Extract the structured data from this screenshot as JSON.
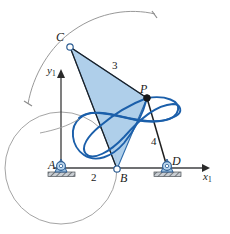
{
  "figure": {
    "background_color": "#ffffff",
    "width": 230,
    "height": 234
  },
  "colors": {
    "coupler_fill": "#a8cbe8",
    "coupler_stroke": "#1f5fa8",
    "coupler_curve": "#1b5faa",
    "link_line": "#262626",
    "ground_line": "#6f7072",
    "crank_circle": "#9a9a9a",
    "arc_path": "#8c8c8c",
    "pivot_body": "#9fc4e2",
    "pivot_outline": "#2c5d93",
    "hatch": "#5b5f63",
    "text": "#1a1a1a"
  },
  "labels": {
    "point_a": "A",
    "point_b": "B",
    "point_c": "C",
    "point_d": "D",
    "point_p": "P",
    "link2": "2",
    "link3": "3",
    "link4": "4",
    "axis_x": "x",
    "axis_x_sub": "1",
    "axis_y": "y",
    "axis_y_sub": "1"
  },
  "geometry": {
    "points": {
      "A": {
        "x": 61,
        "y": 168,
        "role": "fixed-pivot-ground"
      },
      "B": {
        "x": 117,
        "y": 169,
        "role": "moving-pivot-crank-coupler"
      },
      "C": {
        "x": 70,
        "y": 47,
        "role": "coupler-apex"
      },
      "D": {
        "x": 167,
        "y": 168,
        "role": "fixed-pivot-ground"
      },
      "P": {
        "x": 147,
        "y": 98,
        "role": "coupler-point"
      }
    },
    "links": [
      {
        "name": "2",
        "from": "A",
        "to": "B",
        "style": "ground-bar"
      },
      {
        "name": "3",
        "from": "C",
        "to": "B",
        "style": "coupler-triangle"
      },
      {
        "name": "4",
        "from": "P",
        "to": "D",
        "style": "line"
      }
    ],
    "crank_circle": {
      "cx": 61,
      "cy": 168,
      "r": 56
    },
    "coupler_triangle": [
      {
        "x": 70,
        "y": 47
      },
      {
        "x": 117,
        "y": 169
      },
      {
        "x": 147,
        "y": 98
      }
    ],
    "axis_origin": {
      "x": 61,
      "y": 168
    },
    "y_axis_tip": {
      "x": 61,
      "y": 71
    },
    "x_axis_tip": {
      "x": 207,
      "y": 168
    }
  },
  "label_positions": {
    "A": {
      "left": 48,
      "top": 160
    },
    "B": {
      "left": 119,
      "top": 172
    },
    "C": {
      "left": 57,
      "top": 33
    },
    "D": {
      "left": 171,
      "top": 157
    },
    "P": {
      "left": 140,
      "top": 84
    },
    "link2": {
      "left": 90,
      "top": 171
    },
    "link3": {
      "left": 111,
      "top": 61
    },
    "link4": {
      "left": 150,
      "top": 136
    },
    "axis_x": {
      "left": 203,
      "top": 170
    },
    "axis_y": {
      "left": 48,
      "top": 66
    }
  }
}
